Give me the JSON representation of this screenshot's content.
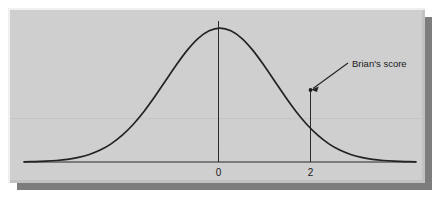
{
  "figure": {
    "title": "",
    "background_color": "#cfcfcf",
    "panel": {
      "fill": "#cfcfcf",
      "highlight_color": "#f2f2f2",
      "shadow_color": "#6e6e6e",
      "x": 10,
      "y": 10,
      "width": 415,
      "height": 173
    },
    "annotation": {
      "label": "Brian's score",
      "leader_from_x": 348,
      "leader_from_y": 63,
      "leader_to_x": 312,
      "leader_to_y": 89,
      "marker_x": 310,
      "marker_y": 90,
      "text_x": 352,
      "text_y": 67
    },
    "ink_color": "#262626"
  },
  "chart_data": {
    "type": "line",
    "title": "",
    "xlabel": "",
    "ylabel": "",
    "curve": "standard normal density",
    "mean": 0,
    "sd": 1,
    "xlim": [
      -3.6,
      3.6
    ],
    "ylim": [
      0,
      0.42
    ],
    "grid": false,
    "legend_position": "none",
    "tick_values": [
      0,
      2
    ],
    "tick_labels": [
      "0",
      "2"
    ],
    "reference_lines": [
      {
        "name": "mean-line",
        "x": 0,
        "from_y": 0,
        "to_y": 0.3989
      },
      {
        "name": "score-line",
        "x": 2,
        "from_y": 0,
        "to_y": 0.054
      }
    ],
    "annotations": [
      {
        "text": "Brian's score",
        "x": 2,
        "y": 0.054
      }
    ],
    "x": [
      -3.6,
      -3.4,
      -3.2,
      -3.0,
      -2.8,
      -2.6,
      -2.4,
      -2.2,
      -2.0,
      -1.8,
      -1.6,
      -1.4,
      -1.2,
      -1.0,
      -0.8,
      -0.6,
      -0.4,
      -0.2,
      0.0,
      0.2,
      0.4,
      0.6,
      0.8,
      1.0,
      1.2,
      1.4,
      1.6,
      1.8,
      2.0,
      2.2,
      2.4,
      2.6,
      2.8,
      3.0,
      3.2,
      3.4,
      3.6
    ],
    "y": [
      0.0006,
      0.0012,
      0.0024,
      0.0044,
      0.0079,
      0.0136,
      0.0224,
      0.0355,
      0.054,
      0.079,
      0.1109,
      0.1497,
      0.1942,
      0.242,
      0.2897,
      0.3332,
      0.3683,
      0.391,
      0.3989,
      0.391,
      0.3683,
      0.3332,
      0.2897,
      0.242,
      0.1942,
      0.1497,
      0.1109,
      0.079,
      0.054,
      0.0355,
      0.0224,
      0.0136,
      0.0079,
      0.0044,
      0.0024,
      0.0012,
      0.0006
    ]
  }
}
